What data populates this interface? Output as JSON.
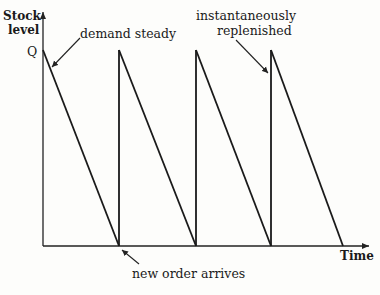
{
  "diagram": {
    "y_axis_label_line1": "Stock",
    "y_axis_label_line2": "level",
    "x_axis_label": "Time",
    "peak_label": "Q",
    "annotations": {
      "demand": "demand steady",
      "replenish_line1": "instantaneously",
      "replenish_line2": "replenished",
      "order": "new order arrives"
    },
    "cycles": 4,
    "peak_level": "Q"
  }
}
